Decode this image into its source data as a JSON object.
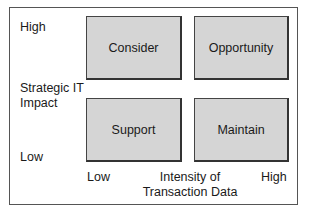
{
  "diagram": {
    "y_axis": {
      "high_label": "High",
      "title_line1": "Strategic IT",
      "title_line2": "Impact",
      "low_label": "Low"
    },
    "x_axis": {
      "low_label": "Low",
      "title_line1": "Intensity of",
      "title_line2": "Transaction Data",
      "high_label": "High"
    },
    "quadrants": [
      {
        "label": "Consider",
        "position": "top-left"
      },
      {
        "label": "Opportunity",
        "position": "top-right"
      },
      {
        "label": "Support",
        "position": "bottom-left"
      },
      {
        "label": "Maintain",
        "position": "bottom-right"
      }
    ],
    "colors": {
      "box_fill": "#d5d5d5",
      "box_border": "#444444",
      "frame_border": "#555555"
    }
  }
}
